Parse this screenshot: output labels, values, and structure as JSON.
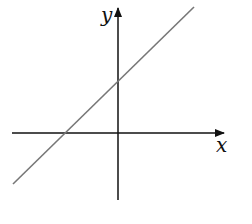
{
  "diagram": {
    "type": "coordinate-plane-line",
    "x_axis_label": "x",
    "y_axis_label": "y",
    "line": {
      "description": "straight line with positive slope, positive y-intercept, negative x-intercept",
      "slope_sign": "positive",
      "y_intercept_sign": "positive",
      "x_intercept_sign": "negative"
    },
    "colors": {
      "axes": "#111111",
      "line": "#777777",
      "background": "#ffffff"
    }
  }
}
